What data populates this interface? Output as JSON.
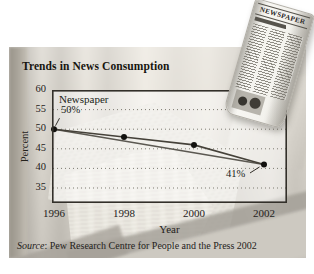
{
  "figure": {
    "title": "Trends in News Consumption",
    "source_italic": "Source",
    "source_rest": ": Pew Research Centre for People and the Press 2002"
  },
  "newspaper_image": {
    "masthead": "NEWSPAPER"
  },
  "chart_data": {
    "type": "line",
    "title": "Trends in News Consumption",
    "xlabel": "Year",
    "ylabel": "Percent",
    "xticks": [
      1996,
      1998,
      2000,
      2002
    ],
    "yticks": [
      60,
      55,
      50,
      45,
      40,
      35
    ],
    "xlim": [
      1996,
      2002.6
    ],
    "ylim": [
      31,
      60
    ],
    "grid": "dotted-horizontal",
    "series": [
      {
        "name": "Newspaper",
        "x": [
          1996,
          1998,
          2000,
          2002
        ],
        "values": [
          50,
          48,
          46,
          41
        ],
        "markers": true
      },
      {
        "name": "Secant line 1996-2002",
        "x": [
          1996,
          2002
        ],
        "values": [
          50,
          41
        ],
        "markers": false
      }
    ],
    "annotations": [
      {
        "text": "50%",
        "x": 1996,
        "y": 50
      },
      {
        "text": "41%",
        "x": 2002,
        "y": 41
      }
    ],
    "legend_position": "top-left-inside"
  }
}
